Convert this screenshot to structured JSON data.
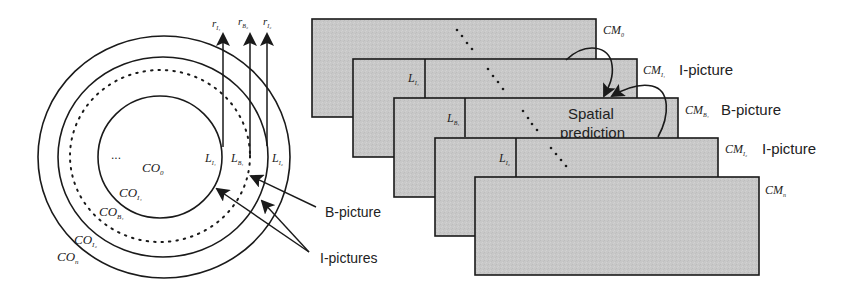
{
  "colors": {
    "stroke": "#1a1a1a",
    "frame_fill": "#c9c9c9",
    "text": "#222222",
    "background": "#ffffff"
  },
  "left_panel": {
    "center": [
      162,
      157
    ],
    "rings": [
      {
        "id": "CO_0",
        "radius": 62,
        "style": "solid",
        "label_main": "CO",
        "label_sub": "0"
      },
      {
        "id": "CO_I1",
        "radius": 62,
        "style": "solid",
        "label_main": "CO",
        "label_sub": "I₁"
      },
      {
        "id": "CO_B1",
        "radius": 90,
        "style": "dotted",
        "label_main": "CO",
        "label_sub": "B₁"
      },
      {
        "id": "CO_I2",
        "radius": 105,
        "style": "solid",
        "label_main": "CO",
        "label_sub": "I₂"
      },
      {
        "id": "CO_n",
        "radius": 126,
        "style": "solid",
        "label_main": "CO",
        "label_sub": "n"
      }
    ],
    "ellipsis": "...",
    "layer_labels": [
      {
        "main": "L",
        "sub": "I₁"
      },
      {
        "main": "L",
        "sub": "B₁"
      },
      {
        "main": "L",
        "sub": "I₂"
      }
    ],
    "rate_labels": [
      {
        "main": "r",
        "sub": "I₁"
      },
      {
        "main": "r",
        "sub": "B₂"
      },
      {
        "main": "r",
        "sub": "I₂"
      }
    ],
    "callouts": {
      "b_picture": "B-picture",
      "i_pictures": "I-pictures"
    }
  },
  "right_panel": {
    "frames": [
      {
        "id": "CM_0",
        "label_main": "CM",
        "label_sub": "0",
        "type_label": ""
      },
      {
        "id": "CM_I1",
        "label_main": "CM",
        "label_sub": "I₁",
        "type_label": "I-picture",
        "layer_main": "L",
        "layer_sub": "I₁"
      },
      {
        "id": "CM_B1",
        "label_main": "CM",
        "label_sub": "B₁",
        "type_label": "B-picture",
        "layer_main": "L",
        "layer_sub": "B₁"
      },
      {
        "id": "CM_I2",
        "label_main": "CM",
        "label_sub": "I₂",
        "type_label": "I-picture",
        "layer_main": "L",
        "layer_sub": "I₂"
      },
      {
        "id": "CM_n",
        "label_main": "CM",
        "label_sub": "n",
        "type_label": ""
      }
    ],
    "spatial_prediction": {
      "line1": "Spatial",
      "line2": "prediction"
    }
  }
}
